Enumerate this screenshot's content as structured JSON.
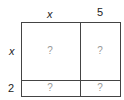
{
  "diagram": {
    "type": "area-model",
    "top_labels": [
      "x",
      "5"
    ],
    "side_labels": [
      "x",
      "2"
    ],
    "cells": [
      [
        "?",
        "?"
      ],
      [
        "?",
        "?"
      ]
    ]
  }
}
